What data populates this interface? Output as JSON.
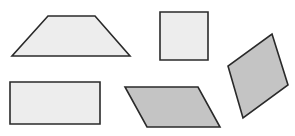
{
  "diagram": {
    "title": "",
    "canvas": {
      "width": 295,
      "height": 136,
      "background": "#ffffff"
    },
    "stroke_color": "#2a2a2a",
    "stroke_width": 1.6,
    "shapes": [
      {
        "id": "trapezoid",
        "type": "trapezoid",
        "fill": "#ededed",
        "points": "48,16 95,16 130,56 12,56"
      },
      {
        "id": "square",
        "type": "square",
        "fill": "#ededed",
        "points": "160,12 208,12 208,60 160,60"
      },
      {
        "id": "rectangle",
        "type": "rectangle",
        "fill": "#ededed",
        "points": "10,82 100,82 100,124 10,124"
      },
      {
        "id": "parallelogram",
        "type": "parallelogram",
        "fill": "#c4c4c4",
        "points": "125,87 198,87 220,127 147,127"
      },
      {
        "id": "rhombus",
        "type": "rhombus",
        "fill": "#c4c4c4",
        "points": "272,34 288,85 243,118 228,66"
      }
    ]
  }
}
